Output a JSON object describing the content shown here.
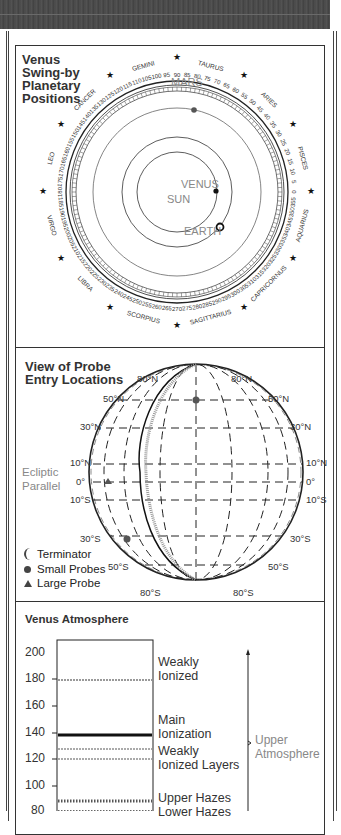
{
  "swingby": {
    "title_lines": [
      "Venus",
      "Swing-by",
      "Planetary",
      "Positions"
    ],
    "zodiac": [
      "GEMINI",
      "TAURUS",
      "ARIES",
      "PISCES",
      "AQUARIUS",
      "CAPRICORNUS",
      "SAGITTARIUS",
      "SCORPIUS",
      "LIBRA",
      "VIRGO",
      "LEO",
      "CANCER"
    ],
    "degree_ticks_step": 5,
    "planets": {
      "sun": "SUN",
      "venus": "VENUS",
      "earth": "EARTH",
      "mars": "MARS"
    }
  },
  "probe": {
    "title_lines": [
      "View of Probe",
      "Entry Locations"
    ],
    "ecliptic_lines": [
      "Ecliptic",
      "Parallel"
    ],
    "lat_labels_top": [
      "80°N",
      "80°N"
    ],
    "lat_labels_left": [
      "50°N",
      "30°N",
      "10°N",
      "0°",
      "10°S",
      "30°S",
      "50°S"
    ],
    "lat_labels_right": [
      "50°N",
      "30°N",
      "10°N",
      "0°",
      "10°S",
      "30°S",
      "50°S"
    ],
    "lat_labels_bottom": [
      "80°S",
      "80°S"
    ],
    "legend": {
      "terminator": "Terminator",
      "small": "Small Probes",
      "large": "Large Probe"
    }
  },
  "atmosphere": {
    "title": "Venus Atmosphere",
    "y_ticks": [
      "200",
      "180",
      "160",
      "140",
      "120",
      "100",
      "80"
    ],
    "layers": [
      {
        "line1": "Weakly",
        "line2": "Ionized"
      },
      {
        "line1": "Main",
        "line2": "Ionization"
      },
      {
        "line1": "Weakly",
        "line2": "Ionized Layers"
      },
      {
        "line1": "Upper Hazes"
      },
      {
        "line1": "Lower Hazes"
      }
    ],
    "region_label": [
      "Upper",
      "Atmosphere"
    ]
  },
  "chart_data": {
    "type": "table",
    "title": "Venus Atmosphere",
    "ylabel": "Altitude (km)",
    "ylim": [
      80,
      200
    ],
    "y_ticks": [
      200,
      180,
      160,
      140,
      120,
      100,
      80
    ],
    "layers": [
      {
        "name": "Weakly Ionized",
        "altitude": 180
      },
      {
        "name": "Main Ionization",
        "altitude": 139
      },
      {
        "name": "Weakly Ionized Layers",
        "altitude": [
          127,
          119
        ]
      },
      {
        "name": "Upper Hazes",
        "altitude": 87
      },
      {
        "name": "Lower Hazes",
        "altitude": 80
      }
    ],
    "region": "Upper Atmosphere"
  }
}
